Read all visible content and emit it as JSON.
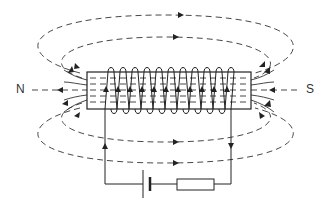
{
  "diagram": {
    "labels": {
      "north": "N",
      "south": "S"
    },
    "components": {
      "solenoid_turns": 11,
      "battery": "cell",
      "resistor": "resistor"
    },
    "colors": {
      "line": "#222222",
      "background": "#ffffff"
    }
  }
}
